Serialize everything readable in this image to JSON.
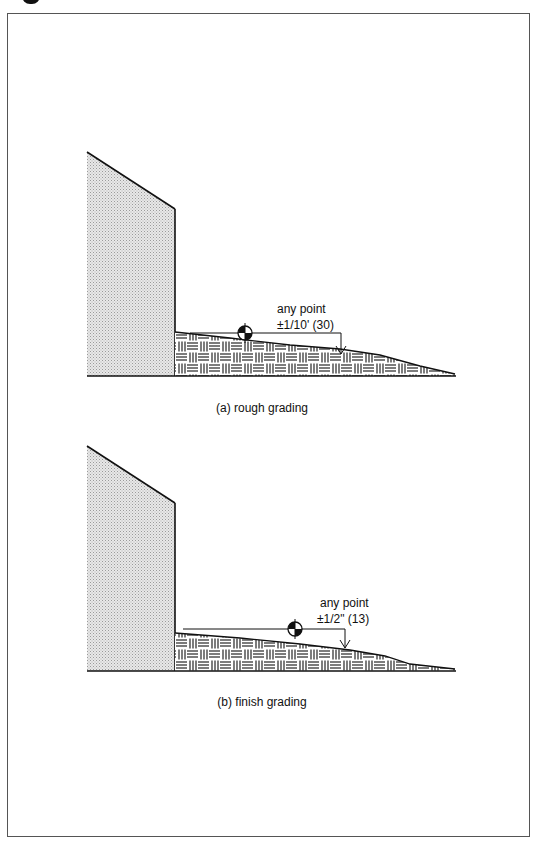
{
  "figures": [
    {
      "id": "a",
      "caption": "(a) rough grading",
      "annotation_line1": "any point",
      "annotation_line2": "±1/10' (30)",
      "tolerance_imperial": "±1/10'",
      "tolerance_metric": "30"
    },
    {
      "id": "b",
      "caption": "(b) finish grading",
      "annotation_line1": "any point",
      "annotation_line2": "±1/2\" (13)",
      "tolerance_imperial": "±1/2\"",
      "tolerance_metric": "13"
    }
  ],
  "icons": {
    "benchmark": "benchmark-symbol-icon",
    "arrow": "down-arrow-icon"
  },
  "colors": {
    "line": "#111111",
    "wall_fill": "#d9d9d9",
    "frame": "#555555"
  }
}
